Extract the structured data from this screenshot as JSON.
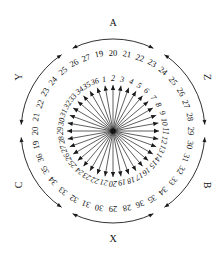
{
  "figure": {
    "type": "radial-sector-rose-diagram",
    "center": {
      "x": 113,
      "y": 131
    },
    "ray_count": 36,
    "inner_label_radius": 52,
    "outer_label_radius": 78,
    "arc_radius": 92,
    "ray_length": 46,
    "line_color": "#1a1a1a",
    "text_color": "#111111",
    "background": "#ffffff"
  },
  "rays": [
    {
      "id": 1,
      "inner_label": "1",
      "outer_label": "19",
      "angle_deg": -100
    },
    {
      "id": 2,
      "inner_label": "2",
      "outer_label": "20",
      "angle_deg": -90
    },
    {
      "id": 3,
      "inner_label": "3",
      "outer_label": "21",
      "angle_deg": -80
    },
    {
      "id": 4,
      "inner_label": "4",
      "outer_label": "22",
      "angle_deg": -70
    },
    {
      "id": 5,
      "inner_label": "5",
      "outer_label": "23",
      "angle_deg": -60
    },
    {
      "id": 6,
      "inner_label": "6",
      "outer_label": "24",
      "angle_deg": -50
    },
    {
      "id": 7,
      "inner_label": "7",
      "outer_label": "25",
      "angle_deg": -40
    },
    {
      "id": 8,
      "inner_label": "8",
      "outer_label": "26",
      "angle_deg": -30
    },
    {
      "id": 9,
      "inner_label": "9",
      "outer_label": "27",
      "angle_deg": -20
    },
    {
      "id": 10,
      "inner_label": "10",
      "outer_label": "28",
      "angle_deg": -10
    },
    {
      "id": 11,
      "inner_label": "11",
      "outer_label": "29",
      "angle_deg": 0
    },
    {
      "id": 12,
      "inner_label": "12",
      "outer_label": "30",
      "angle_deg": 10
    },
    {
      "id": 13,
      "inner_label": "13",
      "outer_label": "31",
      "angle_deg": 20
    },
    {
      "id": 14,
      "inner_label": "14",
      "outer_label": "32",
      "angle_deg": 30
    },
    {
      "id": 15,
      "inner_label": "15",
      "outer_label": "33",
      "angle_deg": 40
    },
    {
      "id": 16,
      "inner_label": "16",
      "outer_label": "34",
      "angle_deg": 50
    },
    {
      "id": 17,
      "inner_label": "17",
      "outer_label": "35",
      "angle_deg": 60
    },
    {
      "id": 18,
      "inner_label": "18",
      "outer_label": "36",
      "angle_deg": 70
    }
  ],
  "groups": [
    {
      "id": "A",
      "label": "A",
      "covers": [
        "19",
        "20",
        "21"
      ],
      "position": "top"
    },
    {
      "id": "Z",
      "label": "Z",
      "covers": [
        "22",
        "23",
        "24"
      ],
      "position": "right"
    },
    {
      "id": "B",
      "label": "B",
      "covers": [
        "25",
        "26",
        "27"
      ],
      "position": "lower-right"
    },
    {
      "id": "X",
      "label": "X",
      "covers": [
        "28",
        "29",
        "30"
      ],
      "position": "bottom"
    },
    {
      "id": "C",
      "label": "C",
      "covers": [
        "31",
        "32",
        "33"
      ],
      "position": "lower-left"
    },
    {
      "id": "Y",
      "label": "Y",
      "covers": [
        "34",
        "35",
        "36"
      ],
      "position": "upper-left"
    }
  ],
  "chart_data": {
    "type": "scatter",
    "title": "",
    "xlabel": "",
    "ylabel": "",
    "categories": [
      "1",
      "2",
      "3",
      "4",
      "5",
      "6",
      "7",
      "8",
      "9",
      "10",
      "11",
      "12",
      "13",
      "14",
      "15",
      "16",
      "17",
      "18",
      "19",
      "20",
      "21",
      "22",
      "23",
      "24",
      "25",
      "26",
      "27",
      "28",
      "29",
      "30",
      "31",
      "32",
      "33",
      "34",
      "35",
      "36"
    ],
    "group_labels": [
      "A",
      "Z",
      "B",
      "X",
      "C",
      "Y"
    ]
  }
}
